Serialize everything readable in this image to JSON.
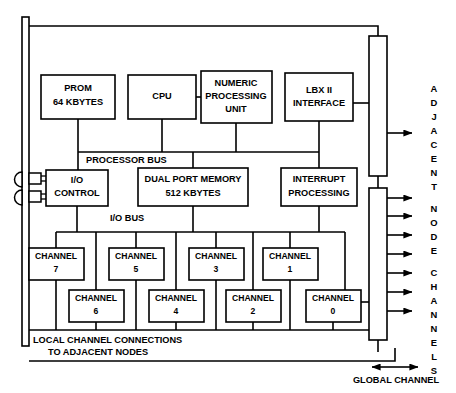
{
  "diagram": {
    "processor_blocks": [
      {
        "name": "prom",
        "lines": [
          "PROM",
          "64 KBYTES"
        ]
      },
      {
        "name": "cpu",
        "lines": [
          "CPU"
        ]
      },
      {
        "name": "npu",
        "lines": [
          "NUMERIC",
          "PROCESSING",
          "UNIT"
        ]
      },
      {
        "name": "lbx",
        "lines": [
          "LBX II",
          "INTERFACE"
        ]
      }
    ],
    "middle_blocks": [
      {
        "name": "io-control",
        "lines": [
          "I/O",
          "CONTROL"
        ]
      },
      {
        "name": "dual-port-memory",
        "lines": [
          "DUAL PORT MEMORY",
          "512 KBYTES"
        ]
      },
      {
        "name": "interrupt",
        "lines": [
          "INTERRUPT",
          "PROCESSING"
        ]
      }
    ],
    "buses": {
      "processor_bus": "PROCESSOR BUS",
      "io_bus": "I/O BUS"
    },
    "channels_top": [
      {
        "name": "channel-7",
        "lines": [
          "CHANNEL",
          "7"
        ]
      },
      {
        "name": "channel-5",
        "lines": [
          "CHANNEL",
          "5"
        ]
      },
      {
        "name": "channel-3",
        "lines": [
          "CHANNEL",
          "3"
        ]
      },
      {
        "name": "channel-1",
        "lines": [
          "CHANNEL",
          "1"
        ]
      }
    ],
    "channels_bottom": [
      {
        "name": "channel-6",
        "lines": [
          "CHANNEL",
          "6"
        ]
      },
      {
        "name": "channel-4",
        "lines": [
          "CHANNEL",
          "4"
        ]
      },
      {
        "name": "channel-2",
        "lines": [
          "CHANNEL",
          "2"
        ]
      },
      {
        "name": "channel-0",
        "lines": [
          "CHANNEL",
          "0"
        ]
      }
    ],
    "notes": {
      "local_connections_line1": "LOCAL CHANNEL CONNECTIONS",
      "local_connections_line2": "TO ADJACENT NODES",
      "global_channel": "GLOBAL CHANNEL"
    },
    "side_label": {
      "text": "ADJACENT NODE CHANNELS",
      "letters_group_1": [
        "A",
        "D",
        "J",
        "A",
        "C",
        "E",
        "N",
        "T"
      ],
      "letters_group_2": [
        "N",
        "O",
        "D",
        "E"
      ],
      "letters_group_3": [
        "C",
        "H",
        "A",
        "N",
        "N",
        "E",
        "L",
        "S"
      ]
    },
    "adjacent_node_arrow_count": 1,
    "node_channel_arrow_count": 7,
    "colors": {
      "line": "#000000",
      "fill": "#ffffff",
      "background": "#ffffff"
    }
  }
}
